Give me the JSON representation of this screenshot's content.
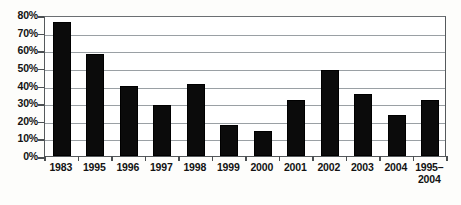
{
  "chart_data": {
    "type": "bar",
    "title": "",
    "subtitle": "",
    "xlabel": "",
    "ylabel": "",
    "categories": [
      "1983",
      "1995",
      "1996",
      "1997",
      "1998",
      "1999",
      "2000",
      "2001",
      "2002",
      "2003",
      "2004",
      "1995–\n2004"
    ],
    "values": [
      76,
      58,
      40,
      29,
      41,
      17.5,
      14,
      32,
      49,
      35,
      23,
      32
    ],
    "ylim": [
      0,
      80
    ],
    "y_ticks": [
      "0%",
      "10%",
      "20%",
      "30%",
      "40%",
      "50%",
      "60%",
      "70%",
      "80%"
    ],
    "y_tick_values": [
      0,
      10,
      20,
      30,
      40,
      50,
      60,
      70,
      80
    ],
    "grid": true,
    "legend": "none",
    "series_color": "#0b0b0b",
    "grid_color": "#9aa0a4",
    "frame_color": "#55595c"
  }
}
